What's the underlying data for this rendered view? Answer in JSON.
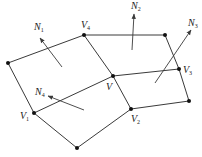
{
  "diagram": {
    "vertices": [
      {
        "id": "V",
        "label": "V",
        "sub": "",
        "x": 113,
        "y": 76,
        "lx": 106,
        "ly": 90
      },
      {
        "id": "V1",
        "label": "V",
        "sub": "1",
        "x": 34,
        "y": 113,
        "lx": 20,
        "ly": 119
      },
      {
        "id": "V2",
        "label": "V",
        "sub": "2",
        "x": 131,
        "y": 109,
        "lx": 131,
        "ly": 122
      },
      {
        "id": "V3",
        "label": "V",
        "sub": "3",
        "x": 179,
        "y": 69,
        "lx": 183,
        "ly": 73
      },
      {
        "id": "V4",
        "label": "V",
        "sub": "4",
        "x": 84,
        "y": 35,
        "lx": 81,
        "ly": 28
      },
      {
        "id": "P_left",
        "label": "",
        "sub": "",
        "x": 8,
        "y": 63
      },
      {
        "id": "P_top",
        "label": "",
        "sub": "",
        "x": 165,
        "y": 35
      },
      {
        "id": "P_right",
        "label": "",
        "sub": "",
        "x": 189,
        "y": 101
      },
      {
        "id": "P_bottom",
        "label": "",
        "sub": "",
        "x": 77,
        "y": 148
      }
    ],
    "edges": [
      [
        "P_left",
        "V4"
      ],
      [
        "V4",
        "P_top"
      ],
      [
        "P_top",
        "V3"
      ],
      [
        "V3",
        "P_right"
      ],
      [
        "P_right",
        "V2"
      ],
      [
        "V2",
        "P_bottom"
      ],
      [
        "P_bottom",
        "V1"
      ],
      [
        "V1",
        "P_left"
      ],
      [
        "V4",
        "V"
      ],
      [
        "V",
        "V2"
      ],
      [
        "V1",
        "V"
      ],
      [
        "V",
        "V3"
      ]
    ],
    "normals": [
      {
        "id": "N1",
        "label": "N",
        "sub": "1",
        "x1": 62,
        "y1": 67,
        "x2": 40,
        "y2": 38,
        "lx": 34,
        "ly": 30
      },
      {
        "id": "N2",
        "label": "N",
        "sub": "2",
        "x1": 132,
        "y1": 50,
        "x2": 134,
        "y2": 14,
        "lx": 131,
        "ly": 9
      },
      {
        "id": "N3",
        "label": "N",
        "sub": "3",
        "x1": 155,
        "y1": 83,
        "x2": 191,
        "y2": 30,
        "lx": 188,
        "ly": 26
      },
      {
        "id": "N4",
        "label": "N",
        "sub": "4",
        "x1": 84,
        "y1": 110,
        "x2": 48,
        "y2": 96,
        "lx": 35,
        "ly": 95
      }
    ],
    "colors": {
      "line": "#3a3a3a",
      "vertex": "#111111",
      "text": "#222222",
      "background": "#ffffff"
    }
  }
}
